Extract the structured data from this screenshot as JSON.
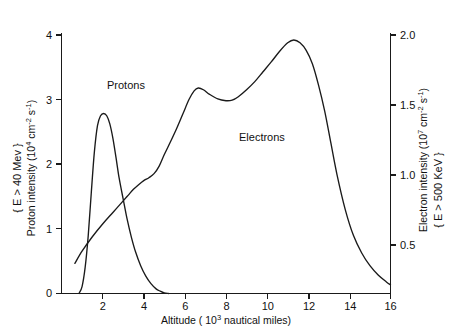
{
  "chart_data": {
    "type": "line",
    "title": "",
    "subtitle": "",
    "xlabel": "Altitude (10³ nautical miles)",
    "xlabel_parts": {
      "text": "Altitude ( 10",
      "exp": "3",
      "tail": " nautical miles)"
    },
    "ylabel_left": "Proton intensity (10⁴ cm⁻² s⁻¹)",
    "ylabel_left_parts": {
      "head": "Proton intensity (10",
      "exp": "4",
      "mid": " cm",
      "exp2": "-2",
      "mid2": " s",
      "exp3": "-1",
      "tail": ")"
    },
    "ylabel_left_condition": "{ E > 40 Mev }",
    "ylabel_right": "Electron intensity (10⁷ cm⁻² s⁻¹)",
    "ylabel_right_parts": {
      "head": "Electron intensity (10",
      "exp": "7",
      "mid": " cm",
      "exp2": "-2",
      "mid2": " s",
      "exp3": "-1",
      "tail": ")"
    },
    "ylabel_right_condition": "{ E > 500 KeV }",
    "xlim": [
      0,
      16
    ],
    "ylim_left": [
      0,
      4.5
    ],
    "ylim_right": [
      0,
      2.25
    ],
    "xticks": [
      0,
      2,
      4,
      6,
      8,
      10,
      12,
      14,
      16
    ],
    "xticklabels": [
      "0",
      "2",
      "4",
      "6",
      "8",
      "10",
      "12",
      "14",
      "16"
    ],
    "yticks_left": [
      0,
      1,
      2,
      3,
      4
    ],
    "yticklabels_left": [
      "0",
      "1",
      "2",
      "3",
      "4"
    ],
    "yticks_right": [
      0.5,
      1.0,
      1.5,
      2.0
    ],
    "yticklabels_right": [
      "0.5",
      "1.0",
      "1.5",
      "2.0"
    ],
    "grid": false,
    "legend_position": "inline-annotations",
    "line_color": "#1a1a1a",
    "series": [
      {
        "name": "Protons",
        "axis": "left",
        "annotation": "Protons",
        "annotation_xy": [
          3.1,
          3.45
        ],
        "x": [
          0.85,
          1.0,
          1.15,
          1.3,
          1.45,
          1.6,
          1.75,
          1.9,
          2.05,
          2.2,
          2.35,
          2.5,
          2.65,
          2.8,
          3.0,
          3.2,
          3.4,
          3.6,
          3.85,
          4.1,
          4.35,
          4.6,
          4.8,
          5.0,
          5.2
        ],
        "y": [
          0.0,
          0.12,
          0.45,
          1.0,
          1.75,
          2.45,
          2.9,
          3.07,
          3.11,
          3.07,
          2.93,
          2.68,
          2.35,
          2.0,
          1.63,
          1.27,
          0.97,
          0.72,
          0.48,
          0.3,
          0.17,
          0.08,
          0.04,
          0.01,
          0.0
        ]
      },
      {
        "name": "Electrons",
        "axis": "right",
        "annotation": "Electrons",
        "annotation_xy": [
          9.2,
          2.62
        ],
        "x": [
          0.65,
          1.0,
          1.5,
          2.0,
          2.5,
          3.0,
          3.25,
          3.5,
          3.75,
          4.0,
          4.25,
          4.5,
          4.75,
          5.0,
          5.3,
          5.6,
          5.9,
          6.2,
          6.45,
          6.65,
          6.9,
          7.2,
          7.6,
          8.0,
          8.3,
          8.6,
          9.0,
          9.4,
          9.8,
          10.2,
          10.6,
          11.0,
          11.3,
          11.6,
          11.9,
          12.2,
          12.5,
          12.8,
          13.1,
          13.4,
          13.8,
          14.2,
          14.6,
          15.0,
          15.4,
          15.8,
          16.0
        ],
        "y_left_units": [
          0.52,
          0.73,
          0.98,
          1.2,
          1.4,
          1.6,
          1.7,
          1.8,
          1.88,
          1.95,
          2.0,
          2.07,
          2.2,
          2.4,
          2.62,
          2.85,
          3.1,
          3.35,
          3.5,
          3.55,
          3.52,
          3.44,
          3.36,
          3.33,
          3.34,
          3.4,
          3.52,
          3.66,
          3.83,
          4.0,
          4.18,
          4.33,
          4.38,
          4.33,
          4.2,
          3.97,
          3.6,
          3.15,
          2.6,
          2.05,
          1.45,
          1.0,
          0.7,
          0.48,
          0.32,
          0.2,
          0.15
        ],
        "y_right_units": [
          0.26,
          0.365,
          0.49,
          0.6,
          0.7,
          0.8,
          0.85,
          0.9,
          0.94,
          0.975,
          1.0,
          1.035,
          1.1,
          1.2,
          1.31,
          1.425,
          1.55,
          1.675,
          1.75,
          1.775,
          1.76,
          1.72,
          1.68,
          1.665,
          1.67,
          1.7,
          1.76,
          1.83,
          1.915,
          2.0,
          2.09,
          2.165,
          2.19,
          2.165,
          2.1,
          1.985,
          1.8,
          1.575,
          1.3,
          1.025,
          0.725,
          0.5,
          0.35,
          0.24,
          0.16,
          0.1,
          0.075
        ]
      }
    ]
  }
}
